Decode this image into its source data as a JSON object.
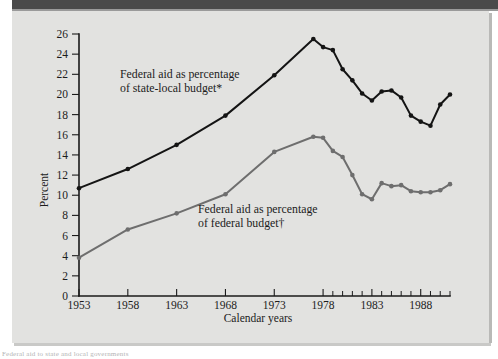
{
  "figure": {
    "background_color": "#e2e2e0",
    "top_bar_color": "#4a4a4a",
    "footnote_fragment": "Federal aid to state and local governments"
  },
  "chart_data": {
    "type": "line",
    "title": "",
    "xlabel": "Calendar years",
    "ylabel": "Percent",
    "xlim": [
      1953,
      1991
    ],
    "ylim": [
      0,
      26
    ],
    "ytick_values": [
      0,
      2,
      4,
      6,
      8,
      10,
      12,
      14,
      16,
      18,
      20,
      22,
      24,
      26
    ],
    "ytick_labels": [
      "0",
      "2",
      "4",
      "6",
      "8",
      "10",
      "12",
      "14",
      "16",
      "18",
      "20",
      "22",
      "24",
      "26"
    ],
    "xtick_values": [
      1953,
      1958,
      1963,
      1968,
      1973,
      1978,
      1983,
      1988
    ],
    "xtick_labels": [
      "1953",
      "1958",
      "1963",
      "1968",
      "1973",
      "1978",
      "1983",
      "1988"
    ],
    "xtick_minor_values": [
      1979,
      1980,
      1981,
      1982,
      1984,
      1985,
      1986,
      1987,
      1989,
      1990,
      1991
    ],
    "grid": false,
    "legend_position": "inline-annotations",
    "series": [
      {
        "name": "Federal aid as percentage of state-local budget*",
        "color": "#141414",
        "label_line1": "Federal aid as percentage",
        "label_line2": "of state-local budget*",
        "label_x": 120,
        "label_y": 78,
        "x": [
          1953,
          1958,
          1963,
          1968,
          1973,
          1977,
          1978,
          1979,
          1980,
          1981,
          1982,
          1983,
          1984,
          1985,
          1986,
          1987,
          1988,
          1989,
          1990,
          1991
        ],
        "y": [
          10.7,
          12.6,
          15.0,
          17.9,
          21.9,
          25.5,
          24.7,
          24.4,
          22.5,
          21.4,
          20.1,
          19.4,
          20.3,
          20.4,
          19.7,
          17.9,
          17.3,
          16.9,
          19.0,
          20.0
        ]
      },
      {
        "name": "Federal aid as percentage of federal budget†",
        "color": "#6e6e6e",
        "label_line1": "Federal aid as percentage",
        "label_line2": "of federal budget†",
        "label_x": 198,
        "label_y": 213,
        "x": [
          1953,
          1958,
          1963,
          1968,
          1973,
          1977,
          1978,
          1979,
          1980,
          1981,
          1982,
          1983,
          1984,
          1985,
          1986,
          1987,
          1988,
          1989,
          1990,
          1991
        ],
        "y": [
          3.8,
          6.6,
          8.2,
          10.1,
          14.3,
          15.8,
          15.7,
          14.4,
          13.8,
          12.0,
          10.1,
          9.6,
          11.2,
          10.9,
          11.0,
          10.4,
          10.3,
          10.3,
          10.5,
          11.1
        ]
      }
    ]
  }
}
